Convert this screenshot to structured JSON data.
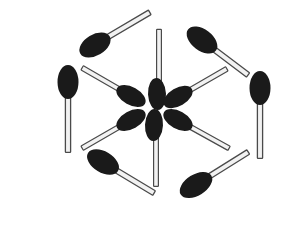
{
  "figure": {
    "label": "5 -",
    "background_color": "#ffffff",
    "match_head_color": "#1a1a1a",
    "match_stick_fill": "#f2f2f2",
    "match_stick_outline": "#4a4a4a",
    "label_color": "#3a3a3a",
    "match_count": 12,
    "hexagon_match_count": 6,
    "radial_match_count": 6,
    "center": {
      "x": 153,
      "y": 106
    },
    "matches": [
      {
        "id": "hex-top-left",
        "group": "hexagon",
        "position": "top-left edge",
        "head_x": 95,
        "head_y": 45,
        "tip_x": 152,
        "tip_y": 11,
        "head_color": "#1a1a1a"
      },
      {
        "id": "hex-top-right",
        "group": "hexagon",
        "position": "top-right edge",
        "head_x": 202,
        "head_y": 40,
        "tip_x": 248,
        "tip_y": 75,
        "head_color": "#1a1a1a"
      },
      {
        "id": "hex-right",
        "group": "hexagon",
        "position": "right edge",
        "head_x": 260,
        "head_y": 88,
        "tip_x": 260,
        "tip_y": 158,
        "head_color": "#1a1a1a"
      },
      {
        "id": "hex-bottom-right",
        "group": "hexagon",
        "position": "bottom-right edge",
        "head_x": 196,
        "head_y": 185,
        "tip_x": 248,
        "tip_y": 153,
        "head_color": "#1a1a1a"
      },
      {
        "id": "hex-bottom-left",
        "group": "hexagon",
        "position": "bottom-left edge",
        "head_x": 103,
        "head_y": 162,
        "tip_x": 158,
        "tip_y": 196,
        "head_color": "#1a1a1a"
      },
      {
        "id": "hex-left",
        "group": "hexagon",
        "position": "left edge",
        "head_x": 68,
        "head_y": 82,
        "tip_x": 68,
        "tip_y": 152,
        "head_color": "#1a1a1a"
      },
      {
        "id": "radial-top",
        "group": "radial",
        "position": "top spoke, head down at centre",
        "head_x": 157,
        "head_y": 94,
        "tip_x": 160,
        "tip_y": 32,
        "head_color": "#1a1a1a"
      },
      {
        "id": "radial-upper-right",
        "group": "radial",
        "position": "upper-right spoke, head down-left at centre",
        "head_x": 178,
        "head_y": 97,
        "tip_x": 231,
        "tip_y": 66,
        "head_color": "#1a1a1a"
      },
      {
        "id": "radial-lower-right",
        "group": "radial",
        "position": "lower-right spoke, head up-left at centre",
        "head_x": 178,
        "head_y": 120,
        "tip_x": 235,
        "tip_y": 151,
        "head_color": "#1a1a1a"
      },
      {
        "id": "radial-bottom",
        "group": "radial",
        "position": "bottom spoke, head up at centre",
        "head_x": 154,
        "head_y": 125,
        "tip_x": 157,
        "tip_y": 186,
        "head_color": "#1a1a1a"
      },
      {
        "id": "radial-lower-left",
        "group": "radial",
        "position": "lower-left spoke, head up-right at centre",
        "head_x": 131,
        "head_y": 120,
        "tip_x": 78,
        "tip_y": 150,
        "head_color": "#1a1a1a"
      },
      {
        "id": "radial-upper-left",
        "group": "radial",
        "position": "upper-left spoke, head down-right at centre",
        "head_x": 131,
        "head_y": 96,
        "tip_x": 78,
        "tip_y": 66,
        "head_color": "#1a1a1a"
      }
    ]
  }
}
